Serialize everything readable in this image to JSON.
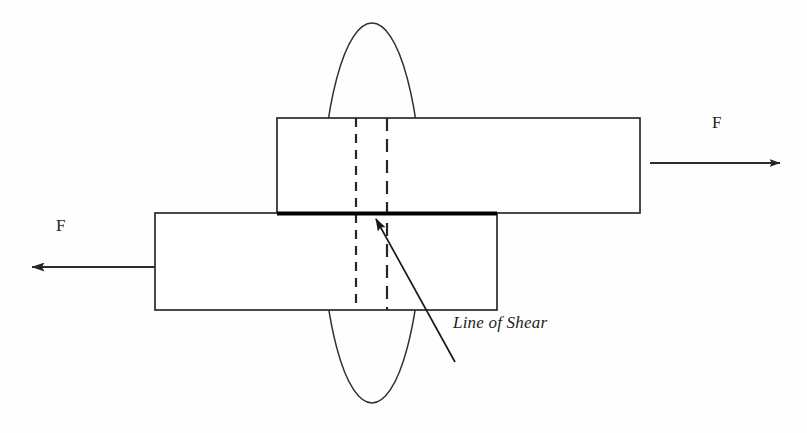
{
  "figure": {
    "type": "engineering-diagram",
    "background_color": "#fefefe",
    "stroke_color": "#2a2a2a",
    "accent_color": "#000000"
  },
  "labels": {
    "force_left": "F",
    "force_right": "F",
    "line_of_shear": "Line of Shear"
  },
  "shapes": {
    "upper_plate": {
      "name": "upper-plate",
      "x": 277,
      "y": 118,
      "width": 363,
      "height": 95
    },
    "lower_plate": {
      "name": "lower-plate",
      "x": 155,
      "y": 213,
      "width": 342,
      "height": 97
    },
    "shear_line": {
      "name": "shear-line",
      "x1": 278,
      "y1": 213,
      "x2": 497,
      "y2": 213,
      "thickness": 4
    },
    "highlight_ellipse": {
      "name": "highlight-ellipse",
      "cx": 372,
      "cy": 213,
      "rx": 50,
      "ry": 190
    },
    "dashed_line_left": {
      "name": "dashed-line-left",
      "x": 356,
      "y1": 118,
      "y2": 310
    },
    "dashed_line_right": {
      "name": "dashed-line-right",
      "x": 387,
      "y1": 118,
      "y2": 310
    },
    "arrow_right": {
      "name": "force-arrow-right",
      "x1": 650,
      "y1": 163,
      "x2": 783,
      "y2": 163,
      "direction": "right"
    },
    "arrow_left": {
      "name": "force-arrow-left",
      "x1": 155,
      "y1": 267,
      "x2": 28,
      "y2": 267,
      "direction": "left"
    },
    "leader_line": {
      "name": "leader-line",
      "x1": 455,
      "y1": 362,
      "x2": 374,
      "y2": 217
    }
  }
}
